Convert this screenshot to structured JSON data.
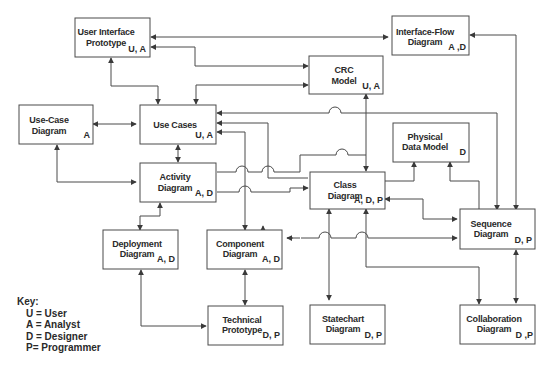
{
  "diagram": {
    "nodes": [
      {
        "id": "ui-prototype",
        "lines": [
          "User Interface",
          "Prototype"
        ],
        "roles": "U, A"
      },
      {
        "id": "interface-flow",
        "lines": [
          "Interface-Flow",
          "Diagram"
        ],
        "roles": "A ,D"
      },
      {
        "id": "crc-model",
        "lines": [
          "CRC",
          "Model"
        ],
        "roles": "U, A"
      },
      {
        "id": "use-case-diagram",
        "lines": [
          "Use-Case",
          "Diagram"
        ],
        "roles": "A"
      },
      {
        "id": "use-cases",
        "lines": [
          "Use Cases",
          ""
        ],
        "roles": "U, A"
      },
      {
        "id": "physical-data-model",
        "lines": [
          "Physical",
          "Data Model"
        ],
        "roles": "D"
      },
      {
        "id": "activity-diagram",
        "lines": [
          "Activity",
          "Diagram"
        ],
        "roles": "A, D"
      },
      {
        "id": "class-diagram",
        "lines": [
          "Class",
          "Diagram"
        ],
        "roles": "A, D, P"
      },
      {
        "id": "sequence-diagram",
        "lines": [
          "Sequence",
          "Diagram"
        ],
        "roles": "D, P"
      },
      {
        "id": "deployment-diagram",
        "lines": [
          "Deployment",
          "Diagram"
        ],
        "roles": "A, D"
      },
      {
        "id": "component-diagram",
        "lines": [
          "Component",
          "Diagram"
        ],
        "roles": "A, D"
      },
      {
        "id": "technical-prototype",
        "lines": [
          "Technical",
          "Prototype"
        ],
        "roles": "D, P"
      },
      {
        "id": "statechart-diagram",
        "lines": [
          "Statechart",
          "Diagram"
        ],
        "roles": "D, P"
      },
      {
        "id": "collaboration-diagram",
        "lines": [
          "Collaboration",
          "Diagram"
        ],
        "roles": "D ,P"
      }
    ]
  },
  "key": {
    "title": "Key:",
    "items": [
      "U = User",
      "A = Analyst",
      "D = Designer",
      "P= Programmer"
    ]
  }
}
